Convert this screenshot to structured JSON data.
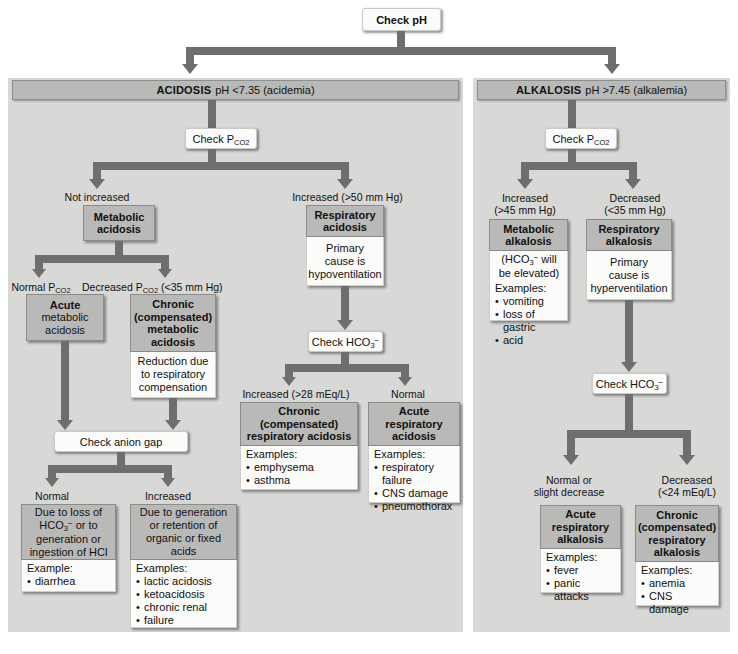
{
  "root": {
    "label": "Check pH"
  },
  "panels": {
    "acidosis": {
      "title": "ACIDOSIS",
      "subtitle": "pH <7.35 (acidemia)",
      "check_pco2": "Check P",
      "check_pco2_sub": "CO2",
      "branches": {
        "not_increased": "Not increased",
        "increased_50": "Increased (>50 mm Hg)"
      },
      "metabolic_acidosis": {
        "title_line1": "Metabolic",
        "title_line2": "acidosis"
      },
      "respiratory_acidosis": {
        "title_line1": "Respiratory",
        "title_line2": "acidosis",
        "body_line1": "Primary",
        "body_line2": "cause is",
        "body_line3": "hypoventilation"
      },
      "pco2_branches": {
        "normal": "Normal P",
        "normal_sub": "CO2",
        "decreased": "Decreased P",
        "decreased_sub": "CO2",
        "decreased_tail": " (<35 mm Hg)"
      },
      "acute_metabolic": {
        "line1": "Acute",
        "line2": "metabolic",
        "line3": "acidosis"
      },
      "chronic_metabolic": {
        "line1": "Chronic",
        "line2": "(compensated)",
        "line3": "metabolic",
        "line4": "acidosis",
        "body_line1": "Reduction due",
        "body_line2": "to respiratory",
        "body_line3": "compensation"
      },
      "check_anion_gap": "Check anion gap",
      "anion_branches": {
        "normal": "Normal",
        "increased": "Increased"
      },
      "normal_gap": {
        "line1": "Due to loss of",
        "line2a": "HCO",
        "line2sub": "3",
        "line2sup": "−",
        "line2b": " or to",
        "line3": "generation or",
        "line4": "ingestion of HCl",
        "examples_label": "Example:",
        "examples": [
          "diarrhea"
        ]
      },
      "increased_gap": {
        "line1": "Due to generation",
        "line2": "or retention of",
        "line3": "organic or fixed",
        "line4": "acids",
        "examples_label": "Examples:",
        "examples": [
          "lactic acidosis",
          "ketoacidosis",
          "chronic renal",
          "  failure"
        ]
      },
      "check_hco3": "Check HCO",
      "check_hco3_sub": "3",
      "check_hco3_sup": "−",
      "hco3_branches": {
        "increased": "Increased (>28 mEq/L)",
        "normal": "Normal"
      },
      "chronic_respiratory": {
        "line1": "Chronic",
        "line2": "(compensated)",
        "line3": "respiratory acidosis",
        "examples_label": "Examples:",
        "examples": [
          "emphysema",
          "asthma"
        ]
      },
      "acute_respiratory": {
        "line1": "Acute",
        "line2": "respiratory",
        "line3": "acidosis",
        "examples_label": "Examples:",
        "examples": [
          "respiratory failure",
          "CNS damage",
          "pneumothorax"
        ]
      }
    },
    "alkalosis": {
      "title": "ALKALOSIS",
      "subtitle": "pH >7.45 (alkalemia)",
      "check_pco2": "Check P",
      "check_pco2_sub": "CO2",
      "branches": {
        "increased": "Increased",
        "increased_val": "(>45 mm Hg)",
        "decreased": "Decreased",
        "decreased_val": "(<35 mm Hg)"
      },
      "metabolic_alkalosis": {
        "line1": "Metabolic",
        "line2": "alkalosis",
        "body_a": "(HCO",
        "body_sub": "3",
        "body_sup": "−",
        "body_b": " will",
        "body_line2": "be elevated)",
        "examples_label": "Examples:",
        "examples": [
          "vomiting",
          "loss of gastric",
          "  acid"
        ]
      },
      "respiratory_alkalosis": {
        "line1": "Respiratory",
        "line2": "alkalosis",
        "body_line1": "Primary",
        "body_line2": "cause is",
        "body_line3": "hyperventilation"
      },
      "check_hco3": "Check HCO",
      "check_hco3_sub": "3",
      "check_hco3_sup": "−",
      "hco3_branches": {
        "normal_l1": "Normal or",
        "normal_l2": "slight decrease",
        "decreased_l1": "Decreased",
        "decreased_l2": "(<24 mEq/L)"
      },
      "acute_respiratory_alk": {
        "line1": "Acute",
        "line2": "respiratory",
        "line3": "alkalosis",
        "examples_label": "Examples:",
        "examples": [
          "fever",
          "panic attacks"
        ]
      },
      "chronic_respiratory_alk": {
        "line1": "Chronic",
        "line2": "(compensated)",
        "line3": "respiratory",
        "line4": "alkalosis",
        "examples_label": "Examples:",
        "examples": [
          "anemia",
          "CNS damage"
        ]
      }
    }
  },
  "colors": {
    "panel_bg": "#d8d8d6",
    "header_grey": "#b9b9b7",
    "connector": "#6e6e6e",
    "white_box": "#fbfbfa"
  }
}
